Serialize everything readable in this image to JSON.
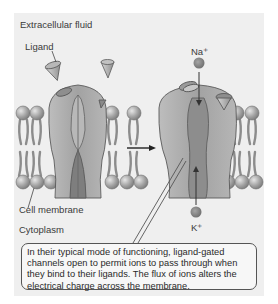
{
  "labels": {
    "extracellular": "Extracellular fluid",
    "ligand": "Ligand",
    "na": "Na⁺",
    "k": "K⁺",
    "cell_membrane": "Cell membrane",
    "cytoplasm": "Cytoplasm"
  },
  "callout": {
    "text": "In their typical mode of functioning, ligand-gated channels open to permit ions to pass through when they bind to their ligands. The flux of ions alters the electrical charge across the membrane."
  },
  "colors": {
    "panel_bg": "#efefef",
    "channel": "#a9a9a9",
    "channel_dark": "#7a7a7a",
    "lipid_head": "#9d9d9d",
    "ion": "#7d7d7d"
  }
}
